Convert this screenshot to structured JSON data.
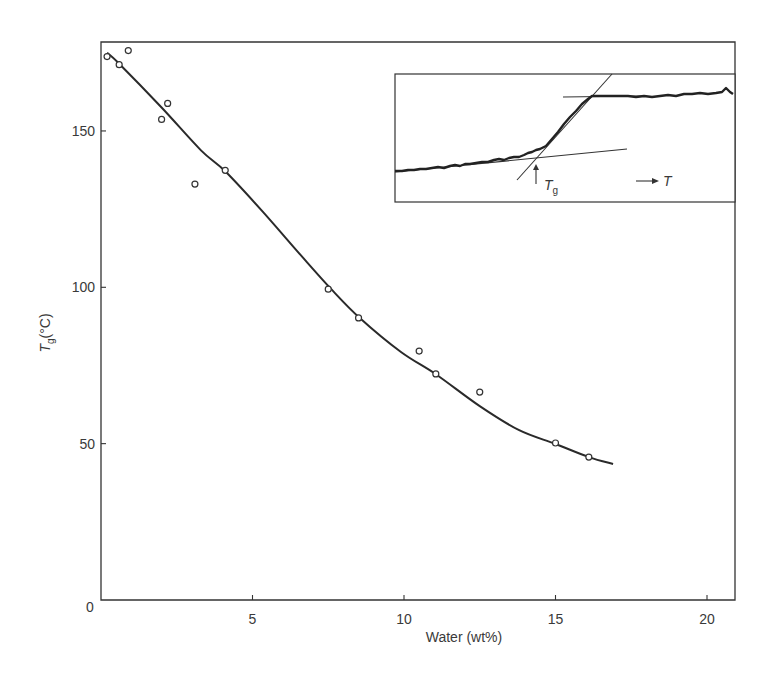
{
  "chart_data": {
    "type": "scatter",
    "title": "",
    "xlabel": "Water (wt%)",
    "ylabel_main": "T",
    "ylabel_sub": "g",
    "ylabel_unit": "(°C)",
    "xlim": [
      0,
      20.9
    ],
    "ylim": [
      0,
      178.5
    ],
    "grid": false,
    "legend": null,
    "x_ticks": [
      {
        "value": 5,
        "label": "5"
      },
      {
        "value": 10,
        "label": "10"
      },
      {
        "value": 15,
        "label": "15"
      },
      {
        "value": 20,
        "label": "20"
      }
    ],
    "y_ticks": [
      {
        "value": 50,
        "label": "50"
      },
      {
        "value": 100,
        "label": "100"
      },
      {
        "value": 150,
        "label": "150"
      }
    ],
    "origin_label": "0",
    "series": [
      {
        "name": "measured Tg",
        "kind": "scatter",
        "marker": "open-circle",
        "points": [
          [
            0.2,
            173.8
          ],
          [
            0.6,
            171.2
          ],
          [
            0.9,
            175.7
          ],
          [
            2.0,
            153.7
          ],
          [
            2.2,
            158.8
          ],
          [
            3.1,
            133.0
          ],
          [
            4.1,
            137.4
          ],
          [
            7.5,
            99.4
          ],
          [
            8.5,
            90.2
          ],
          [
            10.5,
            79.6
          ],
          [
            11.05,
            72.3
          ],
          [
            12.5,
            66.5
          ],
          [
            15.0,
            50.2
          ],
          [
            16.1,
            45.7
          ]
        ]
      },
      {
        "name": "fitted curve",
        "kind": "line",
        "points": [
          [
            0.2,
            175.0
          ],
          [
            0.6,
            171.5
          ],
          [
            2.0,
            157.5
          ],
          [
            3.3,
            143.8
          ],
          [
            4.1,
            137.1
          ],
          [
            5.3,
            124.6
          ],
          [
            6.6,
            110.2
          ],
          [
            7.6,
            99.4
          ],
          [
            8.55,
            90.1
          ],
          [
            9.9,
            79.3
          ],
          [
            11.05,
            72.2
          ],
          [
            12.5,
            62.0
          ],
          [
            13.8,
            54.3
          ],
          [
            15.0,
            49.9
          ],
          [
            16.1,
            45.7
          ],
          [
            16.9,
            43.5
          ]
        ]
      }
    ],
    "inset": {
      "description": "DSC trace showing Tg determination by tangent intersection",
      "tg_label_main": "T",
      "tg_label_sub": "g",
      "temp_arrow_label": "T"
    }
  }
}
